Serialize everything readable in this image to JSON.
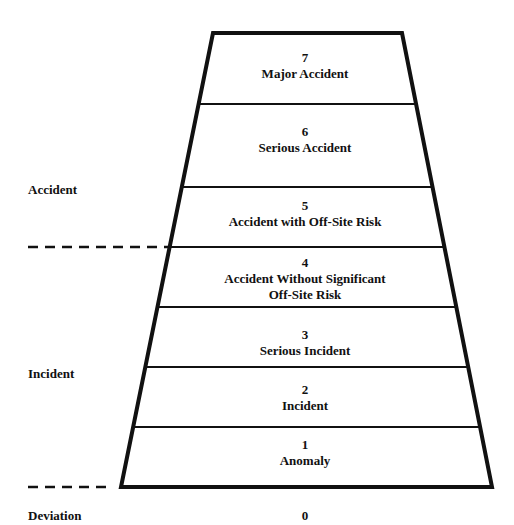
{
  "diagram": {
    "type": "trapezoid-scale",
    "levels": [
      {
        "num": "7",
        "name": "Major Accident"
      },
      {
        "num": "6",
        "name": "Serious Accident"
      },
      {
        "num": "5",
        "name": "Accident with Off-Site Risk"
      },
      {
        "num": "4",
        "name": "Accident Without Significant",
        "name2": "Off-Site Risk"
      },
      {
        "num": "3",
        "name": "Serious Incident"
      },
      {
        "num": "2",
        "name": "Incident"
      },
      {
        "num": "1",
        "name": "Anomaly"
      }
    ],
    "below_scale": {
      "num": "0"
    },
    "categories": {
      "accident": "Accident",
      "incident": "Incident",
      "deviation": "Deviation"
    },
    "colors": {
      "line": "#111111",
      "background": "#ffffff"
    }
  }
}
